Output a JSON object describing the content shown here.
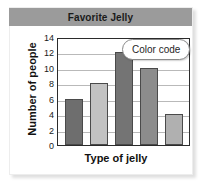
{
  "chart_data": {
    "type": "bar",
    "title": "Favorite Jelly",
    "xlabel": "Type of jelly",
    "ylabel": "Number of people",
    "categories": [
      "1",
      "2",
      "3",
      "4",
      "5"
    ],
    "values": [
      6,
      8,
      12,
      10,
      4
    ],
    "bar_colors": [
      "#6e6e6e",
      "#c2c2c2",
      "#747474",
      "#8c8c8c",
      "#b0b0b0"
    ],
    "ylim": [
      0,
      14
    ],
    "ytick_labels": [
      "14",
      "12",
      "10",
      "8",
      "6",
      "4",
      "2",
      "0"
    ],
    "ytick_values": [
      14,
      12,
      10,
      8,
      6,
      4,
      2,
      0
    ],
    "ytick_step": 2,
    "grid": true,
    "legend": false,
    "annotations": [
      {
        "name": "color-code",
        "text": "Color code"
      }
    ]
  },
  "title_band": {
    "text": "Favorite Jelly",
    "background": "#9b9b9b"
  },
  "callout": {
    "label": "Color code"
  }
}
